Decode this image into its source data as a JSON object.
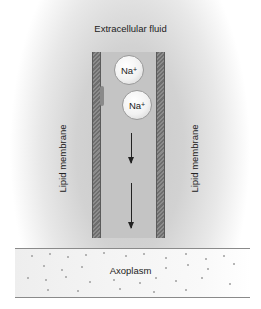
{
  "diagram": {
    "top_label": "Extracellular fluid",
    "left_membrane_label": "Lipid membrane",
    "right_membrane_label": "Lipid membrane",
    "bottom_label": "Axoplasm",
    "ions": [
      {
        "symbol": "Na",
        "charge": "+"
      },
      {
        "symbol": "Na",
        "charge": "+"
      }
    ],
    "arrows": [
      "down",
      "down"
    ]
  }
}
